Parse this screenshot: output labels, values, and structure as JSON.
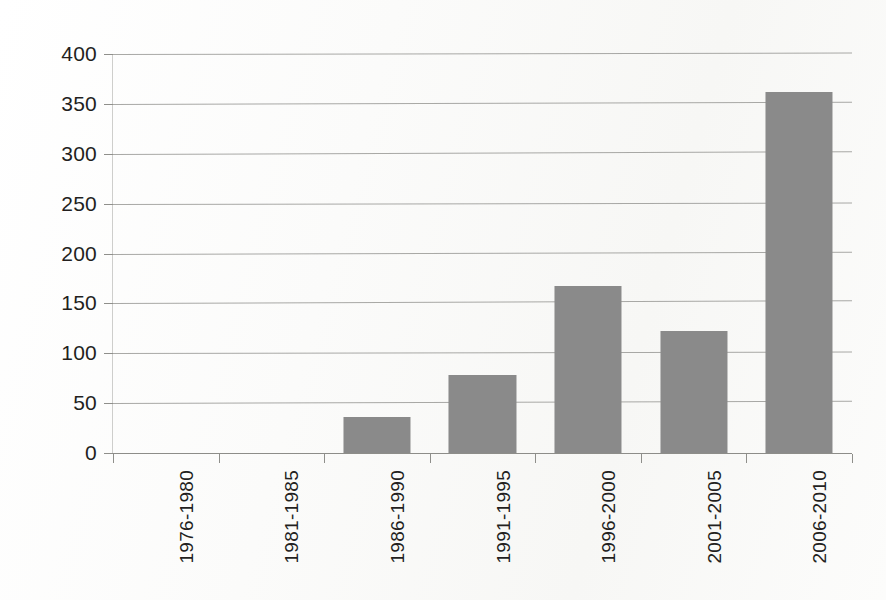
{
  "chart_data": {
    "type": "bar",
    "title": "",
    "subtitle": "",
    "xlabel": "",
    "ylabel": "",
    "categories": [
      "1976-1980",
      "1981-1985",
      "1986-1990",
      "1991-1995",
      "1996-2000",
      "2001-2005",
      "2006-2010"
    ],
    "values": [
      0,
      0,
      36,
      78,
      167,
      122,
      362
    ],
    "ylim": [
      0,
      400
    ],
    "ytick_values": [
      0,
      50,
      100,
      150,
      200,
      250,
      300,
      350,
      400
    ],
    "ytick_labels": [
      "0",
      "50",
      "100",
      "150",
      "200",
      "250",
      "300",
      "350",
      "400"
    ],
    "grid": true,
    "legend": false,
    "legend_position": "none",
    "annotations": [],
    "colors": {
      "bar_fill": "#8a8a8a",
      "gridline": "#9a9a96",
      "axis": "#8d8d89",
      "text": "#231f1e",
      "background": "#fefefe"
    }
  }
}
